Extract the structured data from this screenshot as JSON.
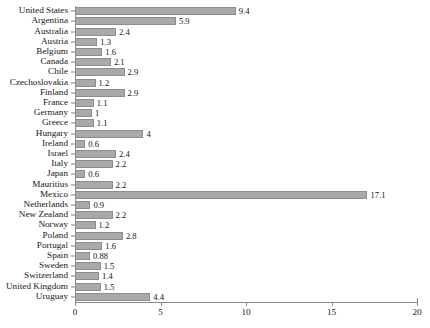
{
  "chart_data": {
    "type": "bar",
    "orientation": "horizontal",
    "title": "",
    "subtitle": "",
    "xlabel": "",
    "ylabel": "",
    "xlim": [
      0,
      20
    ],
    "xticks": [
      0,
      5,
      10,
      15,
      20
    ],
    "xtick_labels": [
      "0",
      "5",
      "10",
      "15",
      "20"
    ],
    "grid": false,
    "legend": false,
    "bar_color": "#a9a9a9",
    "bar_edge_color": "#8c8c8c",
    "value_labels_shown": true,
    "categories": [
      "United States",
      "Argentina",
      "Australia",
      "Austria",
      "Belgium",
      "Canada",
      "Chile",
      "Czechoslovakia",
      "Finland",
      "France",
      "Germany",
      "Greece",
      "Hungary",
      "Ireland",
      "Israel",
      "Italy",
      "Japan",
      "Mauritius",
      "Mexico",
      "Netherlands",
      "New Zealand",
      "Norway",
      "Poland",
      "Portugal",
      "Spain",
      "Sweden",
      "Switzerland",
      "United Kingdom",
      "Uruguay"
    ],
    "values": [
      9.4,
      5.9,
      2.4,
      1.3,
      1.6,
      2.1,
      2.9,
      1.2,
      2.9,
      1.1,
      1,
      1.1,
      4,
      0.6,
      2.4,
      2.2,
      0.6,
      2.2,
      17.1,
      0.9,
      2.2,
      1.2,
      2.8,
      1.6,
      0.88,
      1.5,
      1.4,
      1.5,
      4.4
    ],
    "value_labels": [
      "9.4",
      "5.9",
      "2.4",
      "1.3",
      "1.6",
      "2.1",
      "2.9",
      "1.2",
      "2.9",
      "1.1",
      "1",
      "1.1",
      "4",
      "0.6",
      "2.4",
      "2.2",
      "0.6",
      "2.2",
      "17.1",
      "0.9",
      "2.2",
      "1.2",
      "2.8",
      "1.6",
      "0.88",
      "1.5",
      "1.4",
      "1.5",
      "4.4"
    ]
  }
}
